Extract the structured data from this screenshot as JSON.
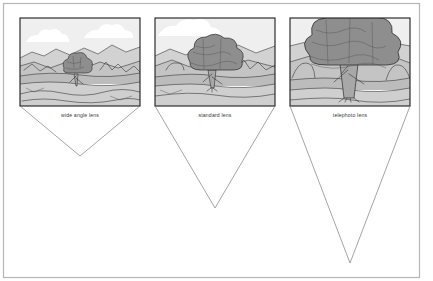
{
  "figure": {
    "background_color": "#ffffff",
    "outer_frame_color": "#b6b6b6",
    "width": 433,
    "height": 281
  },
  "palette": {
    "sky": "#efefef",
    "cloud": "#ffffff",
    "far_hills": "#d2d2d2",
    "mid_hills": "#c4c4c4",
    "ground": "#c9c9c9",
    "foreground": "#cfcfcf",
    "water": "#bcbcbc",
    "tree_canopy": "#8e8e8e",
    "tree_canopy_dark": "#828282",
    "tree_trunk": "#a8a8a8",
    "outline": "#2b2b2b",
    "cone_line": "#7d7d7d",
    "panel_border": "#1c1c1c",
    "label_text": "#3a3a3a"
  },
  "panels": [
    {
      "id": "wide-angle",
      "label": "wide angle lens",
      "frame": {
        "x": 20,
        "y": 18,
        "width": 120,
        "height": 88
      },
      "label_position": {
        "x": 80,
        "y": 116
      },
      "cone": {
        "left_x": 20,
        "right_x": 140,
        "top_y": 106,
        "apex_x": 80,
        "apex_y": 156
      },
      "tree": {
        "center_x": 76,
        "canopy_width": 26,
        "canopy_height": 20,
        "canopy_top_y": 56,
        "trunk_bottom_y": 86
      },
      "horizon_y": 58,
      "relative_tree_size": "small"
    },
    {
      "id": "standard",
      "label": "standard lens",
      "frame": {
        "x": 155,
        "y": 18,
        "width": 120,
        "height": 88
      },
      "label_position": {
        "x": 215,
        "y": 116
      },
      "cone": {
        "left_x": 155,
        "right_x": 275,
        "top_y": 106,
        "apex_x": 215,
        "apex_y": 208
      },
      "tree": {
        "center_x": 212,
        "canopy_width": 48,
        "canopy_height": 40,
        "canopy_top_y": 40,
        "trunk_bottom_y": 88
      },
      "horizon_y": 55,
      "relative_tree_size": "medium"
    },
    {
      "id": "telephoto",
      "label": "telephoto lens",
      "frame": {
        "x": 290,
        "y": 18,
        "width": 120,
        "height": 88
      },
      "label_position": {
        "x": 350,
        "y": 116
      },
      "cone": {
        "left_x": 290,
        "right_x": 410,
        "top_y": 106,
        "apex_x": 350,
        "apex_y": 263
      },
      "tree": {
        "center_x": 348,
        "canopy_width": 86,
        "canopy_height": 64,
        "canopy_top_y": 22,
        "trunk_bottom_y": 98
      },
      "horizon_y": 46,
      "relative_tree_size": "large"
    }
  ]
}
